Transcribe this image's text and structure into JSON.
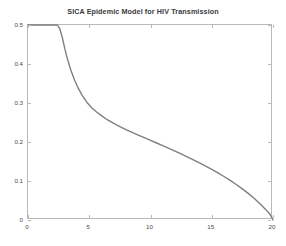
{
  "chart_data": {
    "type": "line",
    "title": "SICA Epidemic Model for HIV Transmission",
    "xlabel": "",
    "ylabel": "",
    "xlim": [
      0,
      20
    ],
    "ylim": [
      0,
      0.5
    ],
    "grid": false,
    "legend": null,
    "xticks": [
      0,
      5,
      10,
      15,
      20
    ],
    "xticklabels": [
      "0",
      "5",
      "10",
      "15",
      "20"
    ],
    "yticks": [
      0,
      0.1,
      0.2,
      0.3,
      0.4,
      0.5
    ],
    "yticklabels": [
      "0",
      "0.1",
      "0.2",
      "0.3",
      "0.4",
      "0.5"
    ],
    "series": [
      {
        "name": "I",
        "color": "#7f7f7f",
        "linewidth": 1.4,
        "x": [
          0,
          0.5,
          1.0,
          1.5,
          2.0,
          2.4,
          2.6,
          2.8,
          3.0,
          3.2,
          3.5,
          3.8,
          4.1,
          4.4,
          4.8,
          5.2,
          5.6,
          6.0,
          6.5,
          7.0,
          7.5,
          8.0,
          8.5,
          9.0,
          9.5,
          10.0,
          10.5,
          11.0,
          11.5,
          12.0,
          12.5,
          13.0,
          13.5,
          14.0,
          14.5,
          15.0,
          15.5,
          16.0,
          16.5,
          17.0,
          17.5,
          18.0,
          18.5,
          19.0,
          19.4,
          19.7,
          19.9,
          20.0
        ],
        "y": [
          0.5,
          0.5,
          0.5,
          0.5,
          0.5,
          0.5,
          0.49,
          0.468,
          0.44,
          0.415,
          0.384,
          0.359,
          0.338,
          0.321,
          0.302,
          0.288,
          0.277,
          0.2675,
          0.2565,
          0.2475,
          0.2395,
          0.232,
          0.2248,
          0.2178,
          0.211,
          0.2042,
          0.1974,
          0.1906,
          0.1836,
          0.1766,
          0.1694,
          0.162,
          0.1544,
          0.1465,
          0.1384,
          0.1299,
          0.121,
          0.1116,
          0.1017,
          0.0911,
          0.0798,
          0.0676,
          0.0544,
          0.04,
          0.0272,
          0.0168,
          0.0068,
          0.0
        ]
      }
    ]
  },
  "figure": {
    "background_color": "#ffffff",
    "axes_color": "#b9b9b9",
    "text_color": "#4a4a4a"
  }
}
